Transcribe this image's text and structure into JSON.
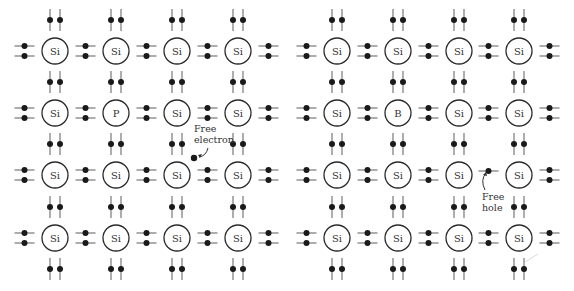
{
  "figure": {
    "panels": [
      {
        "id": "n-type",
        "columns_x": [
          55,
          116,
          177,
          238
        ],
        "rows_y": [
          51,
          113,
          175,
          238
        ],
        "atoms": [
          [
            "Si",
            "Si",
            "Si",
            "Si"
          ],
          [
            "Si",
            "P",
            "Si",
            "Si"
          ],
          [
            "Si",
            "Si",
            "Si",
            "Si"
          ],
          [
            "Si",
            "Si",
            "Si",
            "Si"
          ]
        ],
        "annotation": {
          "lines": [
            "Free",
            "electron"
          ],
          "text_x": 194,
          "text_y": 132,
          "particle_x": 194,
          "particle_y": 158,
          "particle_type": "electron"
        }
      },
      {
        "id": "p-type",
        "columns_x": [
          337,
          398,
          459,
          519
        ],
        "rows_y": [
          51,
          113,
          175,
          238
        ],
        "atoms": [
          [
            "Si",
            "Si",
            "Si",
            "Si"
          ],
          [
            "Si",
            "B",
            "Si",
            "Si"
          ],
          [
            "Si",
            "Si",
            "Si",
            "Si"
          ],
          [
            "Si",
            "Si",
            "Si",
            "Si"
          ]
        ],
        "missing_bond": {
          "row": 2,
          "gap_after_col": 2
        },
        "annotation": {
          "lines": [
            "Free",
            "hole"
          ],
          "text_x": 482,
          "text_y": 200,
          "particle_x": 489,
          "particle_y": 170,
          "particle_type": "hole"
        }
      }
    ],
    "colors": {
      "ink": "#1a1a1a",
      "bond": "#6b6b6b",
      "background": "#ffffff"
    }
  }
}
